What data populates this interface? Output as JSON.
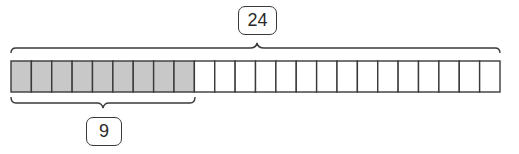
{
  "diagram": {
    "type": "tape-diagram",
    "total_cells": 24,
    "shaded_cells": 9,
    "total_label": "24",
    "part_label": "9",
    "colors": {
      "shaded_fill": "#c8c8c8",
      "unshaded_fill": "#ffffff",
      "stroke": "#3a3a3a"
    }
  }
}
